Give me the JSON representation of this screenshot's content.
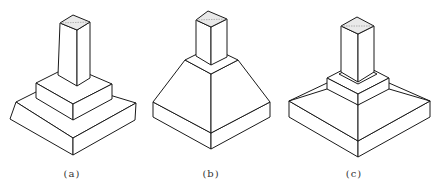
{
  "figure": {
    "colors": {
      "stroke": "#1a1a1a",
      "background": "#ffffff",
      "cap_fill": "#e9e9e9"
    },
    "panels": [
      {
        "id": "a",
        "label": "(a)",
        "type": "stepped-footing",
        "center_x": 72
      },
      {
        "id": "b",
        "label": "(b)",
        "type": "sloped-footing",
        "center_x": 211
      },
      {
        "id": "c",
        "label": "(c)",
        "type": "sloped-footing-with-pedestal",
        "center_x": 354
      }
    ]
  }
}
